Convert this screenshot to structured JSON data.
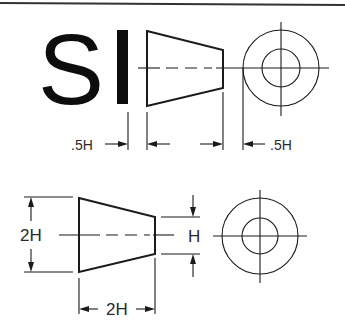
{
  "figure": {
    "title_letters": {
      "s": "S",
      "i": "I"
    },
    "top_view": {
      "labels": {
        "left_gap": ".5H",
        "right_gap": ".5H"
      }
    },
    "bottom_view": {
      "labels": {
        "large_diameter": "2H",
        "small_diameter": "H",
        "length": "2H"
      }
    },
    "colors": {
      "line": "#1a1a1a",
      "background": "#ffffff",
      "border": "#333333"
    }
  }
}
